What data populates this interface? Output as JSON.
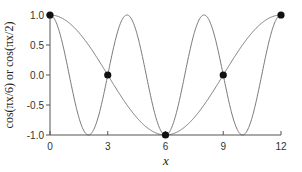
{
  "chart_data": {
    "type": "line",
    "title": "",
    "xlabel": "x",
    "ylabel": "cos(πx/6)  or  cos(πx/2)",
    "xlim": [
      0,
      12
    ],
    "ylim": [
      -1.0,
      1.0
    ],
    "grid": false,
    "legend": null,
    "x_ticks": [
      0,
      3,
      6,
      9,
      12
    ],
    "x_tick_labels": [
      "0",
      "3",
      "6",
      "9",
      "12"
    ],
    "y_ticks": [
      1.0,
      0.5,
      0.0,
      -0.5,
      -1.0
    ],
    "y_tick_labels": [
      "1.0",
      "0.5",
      "0.0",
      "-0.5",
      "-1.0"
    ],
    "series": [
      {
        "name": "cos(πx/6)",
        "function": "cos(pi*x/6)",
        "x": [
          0,
          1,
          2,
          3,
          4,
          5,
          6,
          7,
          8,
          9,
          10,
          11,
          12
        ],
        "values": [
          1.0,
          0.866,
          0.5,
          0.0,
          -0.5,
          -0.866,
          -1.0,
          -0.866,
          -0.5,
          0.0,
          0.5,
          0.866,
          1.0
        ]
      },
      {
        "name": "cos(πx/2)",
        "function": "cos(pi*x/2)",
        "x": [
          0,
          1,
          2,
          3,
          4,
          5,
          6,
          7,
          8,
          9,
          10,
          11,
          12
        ],
        "values": [
          1.0,
          0.0,
          -1.0,
          0.0,
          1.0,
          0.0,
          -1.0,
          0.0,
          1.0,
          0.0,
          -1.0,
          0.0,
          1.0
        ]
      }
    ],
    "markers": {
      "description": "Sample points where both curves coincide",
      "x": [
        0,
        3,
        6,
        9,
        12
      ],
      "y": [
        1.0,
        0.0,
        -1.0,
        0.0,
        1.0
      ]
    }
  },
  "colors": {
    "curve": "#7a7a7a",
    "axis": "#555555",
    "marker": "#111111",
    "text": "#333333"
  }
}
